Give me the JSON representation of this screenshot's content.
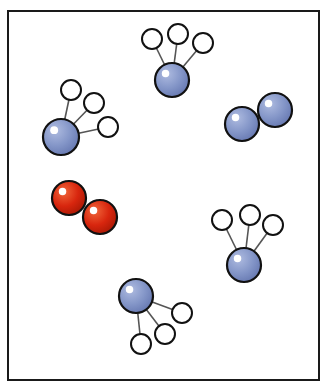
{
  "diagram": {
    "width": 328,
    "height": 387,
    "frame": {
      "x": 8,
      "y": 11,
      "w": 311,
      "h": 369,
      "stroke": "#1a1a1a"
    },
    "colors": {
      "nitrogen_fill": "#8496c8",
      "oxygen_fill": "#d8260e",
      "hydrogen_fill": "#ffffff",
      "outline": "#111111",
      "bond": "#555555",
      "highlight": "#ffffff"
    },
    "molecules": [
      {
        "type": "ammonia",
        "center": {
          "x": 172,
          "y": 80,
          "r": 17
        },
        "hydrogens": [
          {
            "x": 152,
            "y": 39
          },
          {
            "x": 178,
            "y": 34
          },
          {
            "x": 203,
            "y": 43
          }
        ]
      },
      {
        "type": "ammonia",
        "center": {
          "x": 61,
          "y": 137,
          "r": 18
        },
        "hydrogens": [
          {
            "x": 71,
            "y": 90
          },
          {
            "x": 94,
            "y": 103
          },
          {
            "x": 108,
            "y": 127
          }
        ]
      },
      {
        "type": "nitrogen_gas",
        "atoms": [
          {
            "x": 242,
            "y": 124,
            "r": 17
          },
          {
            "x": 275,
            "y": 110,
            "r": 17
          }
        ]
      },
      {
        "type": "oxygen_gas",
        "atoms": [
          {
            "x": 69,
            "y": 198,
            "r": 17
          },
          {
            "x": 100,
            "y": 217,
            "r": 17
          }
        ]
      },
      {
        "type": "ammonia",
        "center": {
          "x": 244,
          "y": 265,
          "r": 17
        },
        "hydrogens": [
          {
            "x": 222,
            "y": 220
          },
          {
            "x": 250,
            "y": 215
          },
          {
            "x": 273,
            "y": 225
          }
        ]
      },
      {
        "type": "ammonia",
        "center": {
          "x": 136,
          "y": 296,
          "r": 17
        },
        "hydrogens": [
          {
            "x": 141,
            "y": 344
          },
          {
            "x": 165,
            "y": 334
          },
          {
            "x": 182,
            "y": 313
          }
        ]
      }
    ],
    "hydrogen_radius": 10
  }
}
